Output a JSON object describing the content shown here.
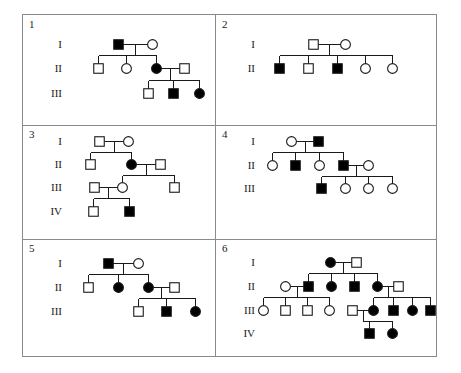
{
  "figure": {
    "type": "pedigree-chart-grid",
    "panel_count": 6,
    "columns": 2,
    "rows": 3,
    "symbol_legend": {
      "square": "male",
      "circle": "female",
      "filled": "affected",
      "open": "unaffected"
    }
  },
  "panels": [
    {
      "id": "panel-1",
      "number": "1",
      "generations": [
        "I",
        "II",
        "III"
      ],
      "individuals": [
        {
          "id": "I-1",
          "gen": "I",
          "shape": "square",
          "affected": true,
          "x": 118,
          "y": 44
        },
        {
          "id": "I-2",
          "gen": "I",
          "shape": "circle",
          "affected": false,
          "x": 152,
          "y": 44
        },
        {
          "id": "II-1",
          "gen": "II",
          "shape": "square",
          "affected": false,
          "x": 98,
          "y": 68
        },
        {
          "id": "II-2",
          "gen": "II",
          "shape": "circle",
          "affected": false,
          "x": 126,
          "y": 68
        },
        {
          "id": "II-3",
          "gen": "II",
          "shape": "circle",
          "affected": true,
          "x": 156,
          "y": 68
        },
        {
          "id": "II-4",
          "gen": "II",
          "shape": "square",
          "affected": false,
          "x": 184,
          "y": 68
        },
        {
          "id": "III-1",
          "gen": "III",
          "shape": "square",
          "affected": false,
          "x": 148,
          "y": 93
        },
        {
          "id": "III-2",
          "gen": "III",
          "shape": "square",
          "affected": true,
          "x": 173,
          "y": 93
        },
        {
          "id": "III-3",
          "gen": "III",
          "shape": "circle",
          "affected": true,
          "x": 199,
          "y": 93
        }
      ],
      "matings": [
        {
          "a": "I-1",
          "b": "I-2",
          "children": [
            "II-1",
            "II-2",
            "II-3"
          ]
        },
        {
          "a": "II-3",
          "b": "II-4",
          "children": [
            "III-1",
            "III-2",
            "III-3"
          ]
        }
      ]
    },
    {
      "id": "panel-2",
      "number": "2",
      "generations": [
        "I",
        "II"
      ],
      "individuals": [
        {
          "id": "I-1",
          "gen": "I",
          "shape": "square",
          "affected": false,
          "x": 313,
          "y": 44
        },
        {
          "id": "I-2",
          "gen": "I",
          "shape": "circle",
          "affected": false,
          "x": 345,
          "y": 44
        },
        {
          "id": "II-1",
          "gen": "II",
          "shape": "square",
          "affected": true,
          "x": 279,
          "y": 68
        },
        {
          "id": "II-2",
          "gen": "II",
          "shape": "square",
          "affected": false,
          "x": 308,
          "y": 68
        },
        {
          "id": "II-3",
          "gen": "II",
          "shape": "square",
          "affected": true,
          "x": 337,
          "y": 68
        },
        {
          "id": "II-4",
          "gen": "II",
          "shape": "circle",
          "affected": false,
          "x": 365,
          "y": 68
        },
        {
          "id": "II-5",
          "gen": "II",
          "shape": "circle",
          "affected": false,
          "x": 392,
          "y": 68
        }
      ],
      "matings": [
        {
          "a": "I-1",
          "b": "I-2",
          "children": [
            "II-1",
            "II-2",
            "II-3",
            "II-4",
            "II-5"
          ]
        }
      ]
    },
    {
      "id": "panel-3",
      "number": "3",
      "generations": [
        "I",
        "II",
        "III",
        "IV"
      ],
      "individuals": [
        {
          "id": "I-1",
          "gen": "I",
          "shape": "square",
          "affected": false,
          "x": 99,
          "y": 141
        },
        {
          "id": "I-2",
          "gen": "I",
          "shape": "circle",
          "affected": false,
          "x": 128,
          "y": 141
        },
        {
          "id": "II-1",
          "gen": "II",
          "shape": "square",
          "affected": false,
          "x": 90,
          "y": 164
        },
        {
          "id": "II-2",
          "gen": "II",
          "shape": "circle",
          "affected": true,
          "x": 131,
          "y": 164
        },
        {
          "id": "II-3",
          "gen": "II",
          "shape": "square",
          "affected": false,
          "x": 160,
          "y": 164
        },
        {
          "id": "III-1",
          "gen": "III",
          "shape": "square",
          "affected": false,
          "x": 94,
          "y": 187
        },
        {
          "id": "III-2",
          "gen": "III",
          "shape": "circle",
          "affected": false,
          "x": 122,
          "y": 187
        },
        {
          "id": "III-3",
          "gen": "III",
          "shape": "square",
          "affected": false,
          "x": 174,
          "y": 187
        },
        {
          "id": "IV-1",
          "gen": "IV",
          "shape": "square",
          "affected": false,
          "x": 93,
          "y": 211
        },
        {
          "id": "IV-2",
          "gen": "IV",
          "shape": "square",
          "affected": true,
          "x": 129,
          "y": 211
        }
      ],
      "matings": [
        {
          "a": "I-1",
          "b": "I-2",
          "children": [
            "II-1",
            "II-2"
          ]
        },
        {
          "a": "II-2",
          "b": "II-3",
          "children": [
            "III-2",
            "III-3"
          ]
        },
        {
          "a": "III-1",
          "b": "III-2",
          "children": [
            "IV-1",
            "IV-2"
          ]
        }
      ]
    },
    {
      "id": "panel-4",
      "number": "4",
      "generations": [
        "I",
        "II",
        "III"
      ],
      "individuals": [
        {
          "id": "I-1",
          "gen": "I",
          "shape": "circle",
          "affected": false,
          "x": 291,
          "y": 141
        },
        {
          "id": "I-2",
          "gen": "I",
          "shape": "square",
          "affected": true,
          "x": 318,
          "y": 141
        },
        {
          "id": "II-1",
          "gen": "II",
          "shape": "circle",
          "affected": false,
          "x": 272,
          "y": 165
        },
        {
          "id": "II-2",
          "gen": "II",
          "shape": "square",
          "affected": true,
          "x": 295,
          "y": 165
        },
        {
          "id": "II-3",
          "gen": "II",
          "shape": "circle",
          "affected": false,
          "x": 319,
          "y": 165
        },
        {
          "id": "II-4",
          "gen": "II",
          "shape": "square",
          "affected": true,
          "x": 343,
          "y": 165
        },
        {
          "id": "II-5",
          "gen": "II",
          "shape": "circle",
          "affected": false,
          "x": 368,
          "y": 165
        },
        {
          "id": "III-1",
          "gen": "III",
          "shape": "square",
          "affected": true,
          "x": 321,
          "y": 188
        },
        {
          "id": "III-2",
          "gen": "III",
          "shape": "circle",
          "affected": false,
          "x": 345,
          "y": 188
        },
        {
          "id": "III-3",
          "gen": "III",
          "shape": "circle",
          "affected": false,
          "x": 368,
          "y": 188
        },
        {
          "id": "III-4",
          "gen": "III",
          "shape": "circle",
          "affected": false,
          "x": 392,
          "y": 188
        }
      ],
      "matings": [
        {
          "a": "I-1",
          "b": "I-2",
          "children": [
            "II-1",
            "II-2",
            "II-3",
            "II-4"
          ]
        },
        {
          "a": "II-4",
          "b": "II-5",
          "children": [
            "III-1",
            "III-2",
            "III-3",
            "III-4"
          ]
        }
      ]
    },
    {
      "id": "panel-5",
      "number": "5",
      "generations": [
        "I",
        "II",
        "III"
      ],
      "individuals": [
        {
          "id": "I-1",
          "gen": "I",
          "shape": "square",
          "affected": true,
          "x": 108,
          "y": 263
        },
        {
          "id": "I-2",
          "gen": "I",
          "shape": "circle",
          "affected": false,
          "x": 138,
          "y": 263
        },
        {
          "id": "II-1",
          "gen": "II",
          "shape": "square",
          "affected": false,
          "x": 88,
          "y": 287
        },
        {
          "id": "II-2",
          "gen": "II",
          "shape": "circle",
          "affected": true,
          "x": 118,
          "y": 287
        },
        {
          "id": "II-3",
          "gen": "II",
          "shape": "circle",
          "affected": true,
          "x": 148,
          "y": 287
        },
        {
          "id": "II-4",
          "gen": "II",
          "shape": "square",
          "affected": false,
          "x": 174,
          "y": 287
        },
        {
          "id": "III-1",
          "gen": "III",
          "shape": "square",
          "affected": false,
          "x": 138,
          "y": 311
        },
        {
          "id": "III-2",
          "gen": "III",
          "shape": "square",
          "affected": true,
          "x": 166,
          "y": 311
        },
        {
          "id": "III-3",
          "gen": "III",
          "shape": "circle",
          "affected": true,
          "x": 195,
          "y": 311
        }
      ],
      "matings": [
        {
          "a": "I-1",
          "b": "I-2",
          "children": [
            "II-1",
            "II-2",
            "II-3"
          ]
        },
        {
          "a": "II-3",
          "b": "II-4",
          "children": [
            "III-1",
            "III-2",
            "III-3"
          ]
        }
      ]
    },
    {
      "id": "panel-6",
      "number": "6",
      "generations": [
        "I",
        "II",
        "III",
        "IV"
      ],
      "individuals": [
        {
          "id": "I-1",
          "gen": "I",
          "shape": "circle",
          "affected": true,
          "x": 330,
          "y": 262
        },
        {
          "id": "I-2",
          "gen": "I",
          "shape": "square",
          "affected": false,
          "x": 356,
          "y": 262
        },
        {
          "id": "II-1",
          "gen": "II",
          "shape": "circle",
          "affected": false,
          "x": 285,
          "y": 286
        },
        {
          "id": "II-2",
          "gen": "II",
          "shape": "square",
          "affected": true,
          "x": 308,
          "y": 286
        },
        {
          "id": "II-3",
          "gen": "II",
          "shape": "circle",
          "affected": true,
          "x": 331,
          "y": 286
        },
        {
          "id": "II-4",
          "gen": "II",
          "shape": "square",
          "affected": true,
          "x": 354,
          "y": 286
        },
        {
          "id": "II-5",
          "gen": "II",
          "shape": "circle",
          "affected": true,
          "x": 377,
          "y": 286
        },
        {
          "id": "II-6",
          "gen": "II",
          "shape": "square",
          "affected": false,
          "x": 398,
          "y": 286
        },
        {
          "id": "III-1",
          "gen": "III",
          "shape": "circle",
          "affected": false,
          "x": 263,
          "y": 310
        },
        {
          "id": "III-2",
          "gen": "III",
          "shape": "square",
          "affected": false,
          "x": 285,
          "y": 310
        },
        {
          "id": "III-3",
          "gen": "III",
          "shape": "square",
          "affected": false,
          "x": 307,
          "y": 310
        },
        {
          "id": "III-4",
          "gen": "III",
          "shape": "circle",
          "affected": false,
          "x": 329,
          "y": 310
        },
        {
          "id": "III-5",
          "gen": "III",
          "shape": "square",
          "affected": false,
          "x": 352,
          "y": 310
        },
        {
          "id": "III-6",
          "gen": "III",
          "shape": "circle",
          "affected": true,
          "x": 373,
          "y": 310
        },
        {
          "id": "III-7",
          "gen": "III",
          "shape": "square",
          "affected": true,
          "x": 393,
          "y": 310
        },
        {
          "id": "III-8",
          "gen": "III",
          "shape": "circle",
          "affected": true,
          "x": 412,
          "y": 310
        },
        {
          "id": "III-9",
          "gen": "III",
          "shape": "square",
          "affected": true,
          "x": 430,
          "y": 310
        },
        {
          "id": "IV-1",
          "gen": "IV",
          "shape": "square",
          "affected": true,
          "x": 369,
          "y": 333
        },
        {
          "id": "IV-2",
          "gen": "IV",
          "shape": "circle",
          "affected": true,
          "x": 392,
          "y": 333
        }
      ],
      "matings": [
        {
          "a": "I-1",
          "b": "I-2",
          "children": [
            "II-2",
            "II-3",
            "II-4",
            "II-5"
          ]
        },
        {
          "a": "II-1",
          "b": "II-2",
          "children": [
            "III-1",
            "III-2",
            "III-3",
            "III-4"
          ]
        },
        {
          "a": "II-5",
          "b": "II-6",
          "children": [
            "III-6",
            "III-7",
            "III-8",
            "III-9"
          ]
        },
        {
          "a": "III-5",
          "b": "III-6",
          "children": [
            "IV-1",
            "IV-2"
          ]
        }
      ]
    }
  ]
}
